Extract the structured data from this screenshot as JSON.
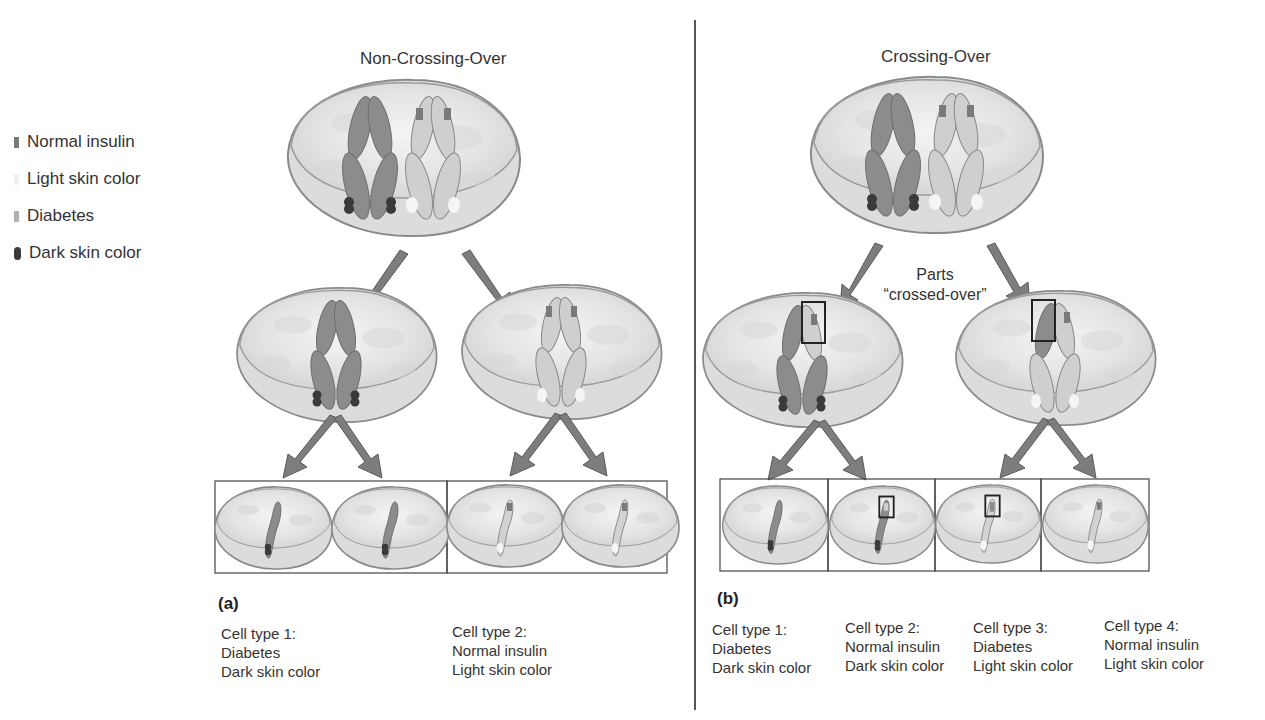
{
  "legend": {
    "items": [
      {
        "label": "Normal insulin",
        "icon": "normal-insulin-swatch",
        "color": "#7a7a7a"
      },
      {
        "label": "Light skin color",
        "icon": "light-skin-swatch",
        "color": "#f2f2f2"
      },
      {
        "label": "Diabetes",
        "icon": "diabetes-swatch",
        "color": "#b4b4b4"
      },
      {
        "label": "Dark skin color",
        "icon": "dark-skin-swatch",
        "color": "#3a3a3a"
      }
    ]
  },
  "panel_a": {
    "title": "Non-Crossing-Over",
    "label": "(a)",
    "cell_types": [
      {
        "name": "Cell type 1:",
        "trait1": "Diabetes",
        "trait2": "Dark skin color"
      },
      {
        "name": "Cell type 2:",
        "trait1": "Normal insulin",
        "trait2": "Light skin color"
      }
    ]
  },
  "panel_b": {
    "title": "Crossing-Over",
    "label": "(b)",
    "note_line1": "Parts",
    "note_line2": "“crossed-over”",
    "cell_types": [
      {
        "name": "Cell type 1:",
        "trait1": "Diabetes",
        "trait2": "Dark skin color"
      },
      {
        "name": "Cell type 2:",
        "trait1": "Normal insulin",
        "trait2": "Dark skin color"
      },
      {
        "name": "Cell type 3:",
        "trait1": "Diabetes",
        "trait2": "Light skin color"
      },
      {
        "name": "Cell type 4:",
        "trait1": "Normal insulin",
        "trait2": "Light skin color"
      }
    ]
  },
  "colors": {
    "cell_fill": "#e6e6e6",
    "cell_stroke": "#8a8a8a",
    "arrow": "#7d7d7d",
    "dark_chromosome": "#8c8c8c",
    "light_chromosome": "#d4d4d4"
  }
}
